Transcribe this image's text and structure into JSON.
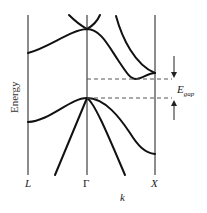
{
  "diagram": {
    "type": "band-structure",
    "y_axis_label": "Energy",
    "x_axis_label": "k",
    "k_points": [
      {
        "name": "L",
        "italic": true
      },
      {
        "name": "Γ",
        "italic": false
      },
      {
        "name": "X",
        "italic": true
      }
    ],
    "gap_label": {
      "main": "E",
      "subscript": "gap"
    },
    "bands": [
      {
        "name": "conduction-band-upper-left",
        "region": "Γ"
      },
      {
        "name": "conduction-band-upper-right",
        "region": "Γ"
      },
      {
        "name": "conduction-band-main",
        "region": "L-Γ-X"
      },
      {
        "name": "conduction-band-x",
        "region": "Γ-X"
      },
      {
        "name": "valence-band-top",
        "region": "L-Γ-X"
      },
      {
        "name": "valence-band-left-steep",
        "region": "L-Γ"
      },
      {
        "name": "valence-band-right-steep",
        "region": "Γ-X"
      }
    ],
    "annotations": [
      "conduction-band-minimum-dash",
      "valence-band-maximum-dash",
      "gap-arrows"
    ]
  }
}
